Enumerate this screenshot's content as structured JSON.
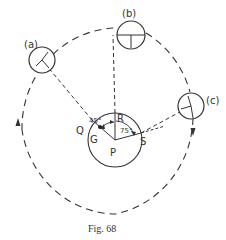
{
  "figure": {
    "caption": "Fig. 68",
    "labels": {
      "a": "(a)",
      "b": "(b)",
      "c": "(c)",
      "Q": "Q",
      "R": "R",
      "S": "S",
      "G": "G",
      "P": "P",
      "angle_QR": "45°",
      "angle_RS": "75°"
    },
    "colors": {
      "stroke": "#333333",
      "background": "#ffffff"
    }
  }
}
